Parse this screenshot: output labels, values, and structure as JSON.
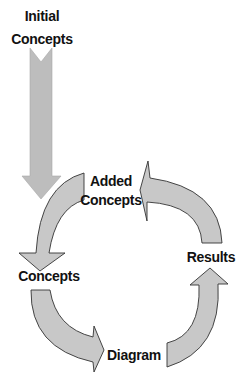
{
  "diagram": {
    "type": "cycle-flow",
    "colors": {
      "fill": "#c8c8c8",
      "stroke": "#333333",
      "input_arrow_fill": "#bdbdbd",
      "text": "#111111"
    },
    "nodes": [
      {
        "id": "initial",
        "line1": "Initial",
        "line2": "Concepts"
      },
      {
        "id": "added",
        "line1": "Added",
        "line2": "Concepts"
      },
      {
        "id": "concepts",
        "label": "Concepts"
      },
      {
        "id": "results",
        "label": "Results"
      },
      {
        "id": "diagram",
        "label": "Diagram"
      }
    ],
    "edges": [
      {
        "from": "Initial Concepts",
        "to": "cycle"
      },
      {
        "from": "Added Concepts",
        "to": "Concepts"
      },
      {
        "from": "Concepts",
        "to": "Diagram"
      },
      {
        "from": "Diagram",
        "to": "Results"
      },
      {
        "from": "Results",
        "to": "Added Concepts"
      }
    ]
  }
}
